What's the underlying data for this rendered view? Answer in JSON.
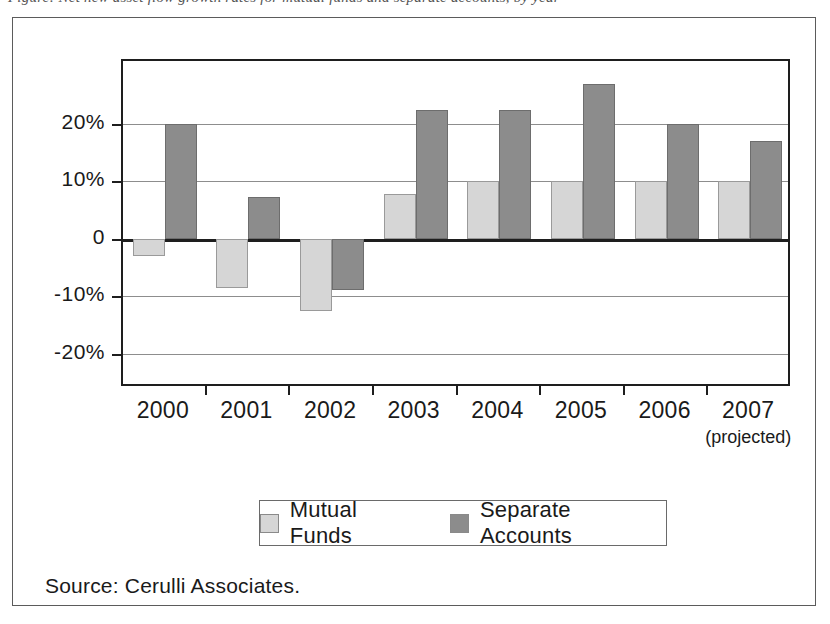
{
  "figure": {
    "cut_off_caption": "Figure: Net new asset flow growth rates for mutual funds and separate accounts, by year",
    "source_note": "Source: Cerulli Associates."
  },
  "legend": {
    "position": "bottom-center",
    "items": [
      {
        "label": "Mutual Funds",
        "color": "#d6d6d6",
        "swatch": "legend-swatch-mutual-funds"
      },
      {
        "label": "Separate Accounts",
        "color": "#8c8c8c",
        "swatch": "legend-swatch-separate-accounts"
      }
    ]
  },
  "axes": {
    "y_ticks": [
      "20%",
      "10%",
      "0",
      "-10%",
      "-20%"
    ],
    "y_tick_values": [
      20,
      10,
      0,
      -10,
      -20
    ],
    "x_labels": [
      "2000",
      "2001",
      "2002",
      "2003",
      "2004",
      "2005",
      "2006",
      "2007"
    ],
    "x_sublabel_2007": "(projected)"
  },
  "chart_data": {
    "type": "bar",
    "title": "",
    "xlabel": "",
    "ylabel": "",
    "categories": [
      "2000",
      "2001",
      "2002",
      "2003",
      "2004",
      "2005",
      "2006",
      "2007"
    ],
    "series": [
      {
        "name": "Mutual Funds",
        "color": "#d6d6d6",
        "values": [
          -3,
          -8.5,
          -12.5,
          7.8,
          10,
          10,
          10,
          10
        ]
      },
      {
        "name": "Separate Accounts",
        "color": "#8c8c8c",
        "values": [
          20,
          7.3,
          -9,
          22.5,
          22.5,
          27,
          20,
          17
        ]
      }
    ],
    "ylim": [
      -26,
      31
    ],
    "ytick_values": [
      20,
      10,
      0,
      -10,
      -20
    ],
    "ytick_labels": [
      "20%",
      "10%",
      "0",
      "-10%",
      "-20%"
    ],
    "grid": true,
    "grid_axis": "y",
    "zero_line": true,
    "legend_position": "bottom-center",
    "annotations": [
      "2007 values are projected"
    ],
    "unit": "percent"
  }
}
